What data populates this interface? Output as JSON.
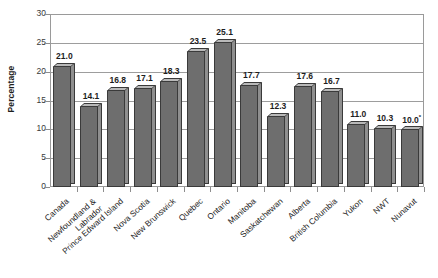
{
  "chart_data": {
    "type": "bar",
    "title": "",
    "subtitle": "",
    "xlabel": "",
    "ylabel": "Percentage",
    "ylim": [
      0,
      30
    ],
    "ytick_step": 5,
    "yticks": [
      0,
      5,
      10,
      15,
      20,
      25,
      30
    ],
    "grid": true,
    "legend": false,
    "style": "3d-bar-grayscale",
    "bar_color": "#6e6e6e",
    "bar_top_color": "#b9b9b9",
    "bar_side_color": "#8f8f8f",
    "bar_outline_color": "#3a3a3a",
    "categories": [
      "Canada",
      "Newfoundland & Labrador",
      "Prince Edward Island",
      "Nova Scotia",
      "New Brunswick",
      "Quebec",
      "Ontario",
      "Manitoba",
      "Saskatchewan",
      "Alberta",
      "British Columbia",
      "Yukon",
      "NWT",
      "Nunavut"
    ],
    "values": [
      21.0,
      14.1,
      16.8,
      17.1,
      18.3,
      23.5,
      25.1,
      17.7,
      12.3,
      17.6,
      16.7,
      11.0,
      10.3,
      10.0
    ],
    "data_labels": [
      "21.0",
      "14.1",
      "16.8",
      "17.1",
      "18.3",
      "23.5",
      "25.1",
      "17.7",
      "12.3",
      "17.6",
      "16.7",
      "11.0",
      "10.3",
      "10.0"
    ],
    "annotations": [
      {
        "category": "Nunavut",
        "marker": "*",
        "applies_to_label": "10.0"
      }
    ]
  },
  "axis": {
    "y_title": "Percentage",
    "y_tick_labels": [
      "30",
      "25",
      "20",
      "15",
      "10",
      "5",
      "0"
    ]
  },
  "category_lines": [
    [
      "Canada",
      ""
    ],
    [
      "Newfoundland &",
      "Labrador"
    ],
    [
      "Prince Edward Island",
      ""
    ],
    [
      "Nova Scotia",
      ""
    ],
    [
      "New Brunswick",
      ""
    ],
    [
      "Quebec",
      ""
    ],
    [
      "Ontario",
      ""
    ],
    [
      "Manitoba",
      ""
    ],
    [
      "Saskatchewan",
      ""
    ],
    [
      "Alberta",
      ""
    ],
    [
      "British Columbia",
      ""
    ],
    [
      "Yukon",
      ""
    ],
    [
      "NWT",
      ""
    ],
    [
      "Nunavut",
      ""
    ]
  ]
}
